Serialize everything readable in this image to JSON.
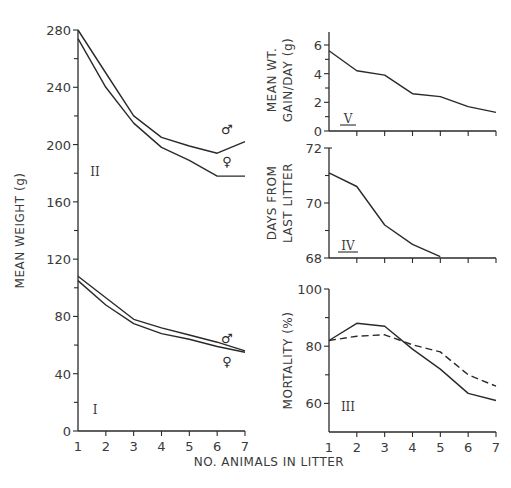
{
  "chart_data": [
    {
      "id": "panel-weight",
      "type": "line",
      "ylabel": "MEAN WEIGHT (g)",
      "xlabel": "NO. ANIMALS IN LITTER",
      "x": [
        1,
        2,
        3,
        4,
        5,
        6,
        7
      ],
      "x_tick_labels": [
        "1",
        "2",
        "3",
        "4",
        "5",
        "6",
        "7"
      ],
      "ylim": [
        0,
        280
      ],
      "y_ticks": [
        0,
        40,
        80,
        120,
        160,
        200,
        240,
        280
      ],
      "y_tick_labels": [
        "0",
        "40",
        "80",
        "120",
        "160",
        "200",
        "240",
        "280"
      ],
      "y_minor_ticks": [
        20,
        60,
        100,
        140,
        180,
        220,
        260
      ],
      "subplots": [
        {
          "label": "II",
          "series": [
            {
              "name": "male",
              "symbol": "♂",
              "style": "solid",
              "values": [
                280,
                250,
                220,
                205,
                199,
                194,
                202
              ]
            },
            {
              "name": "female",
              "symbol": "♀",
              "style": "solid",
              "values": [
                274,
                240,
                215,
                198,
                189,
                178,
                178
              ]
            }
          ]
        },
        {
          "label": "I",
          "series": [
            {
              "name": "male",
              "symbol": "♂",
              "style": "solid",
              "values": [
                108,
                93,
                78,
                72,
                67,
                62,
                56
              ]
            },
            {
              "name": "female",
              "symbol": "♀",
              "style": "solid",
              "values": [
                105,
                88,
                75,
                68,
                64,
                59,
                55
              ]
            }
          ]
        }
      ]
    },
    {
      "id": "panel-gain",
      "type": "line",
      "label": "V",
      "ylabel": "MEAN WT. GAIN/DAY (g)",
      "ylabel_lines": [
        "MEAN WT.",
        "GAIN/DAY (g)"
      ],
      "x": [
        1,
        2,
        3,
        4,
        5,
        6,
        7
      ],
      "ylim": [
        0,
        7
      ],
      "y_ticks": [
        0,
        2,
        4,
        6
      ],
      "y_tick_labels": [
        "0",
        "2",
        "4",
        "6"
      ],
      "y_minor_ticks": [
        1,
        3,
        5
      ],
      "series": [
        {
          "name": "gain",
          "style": "solid",
          "values": [
            5.6,
            4.2,
            3.9,
            2.6,
            2.4,
            1.7,
            1.3
          ]
        }
      ]
    },
    {
      "id": "panel-days",
      "type": "line",
      "label": "IV",
      "ylabel": "DAYS FROM LAST LITTER",
      "ylabel_lines": [
        "DAYS FROM",
        "LAST LITTER"
      ],
      "x": [
        1,
        2,
        3,
        4,
        5
      ],
      "ylim": [
        68,
        72
      ],
      "y_ticks": [
        68,
        70,
        72
      ],
      "y_tick_labels": [
        "68",
        "70",
        "72"
      ],
      "y_minor_ticks": [
        69,
        71
      ],
      "series": [
        {
          "name": "days",
          "style": "solid",
          "values": [
            71.1,
            70.6,
            69.2,
            68.5,
            68.05
          ]
        }
      ]
    },
    {
      "id": "panel-mortality",
      "type": "line",
      "label": "III",
      "ylabel": "MORTALITY (%)",
      "xlabel": "NO. ANIMALS IN LITTER",
      "x": [
        1,
        2,
        3,
        4,
        5,
        6,
        7
      ],
      "x_tick_labels": [
        "1",
        "2",
        "3",
        "4",
        "5",
        "6",
        "7"
      ],
      "ylim": [
        50,
        100
      ],
      "y_ticks": [
        60,
        80,
        100
      ],
      "y_tick_labels": [
        "60",
        "80",
        "100"
      ],
      "y_minor_ticks": [
        70,
        90
      ],
      "series": [
        {
          "name": "solid",
          "style": "solid",
          "values": [
            82,
            88,
            87,
            79,
            72,
            63.5,
            61
          ]
        },
        {
          "name": "dashed",
          "style": "dashed",
          "values": [
            82,
            83.5,
            84,
            80.5,
            78,
            70,
            66
          ]
        }
      ]
    }
  ],
  "shared_xlabel": "NO. ANIMALS IN LITTER"
}
